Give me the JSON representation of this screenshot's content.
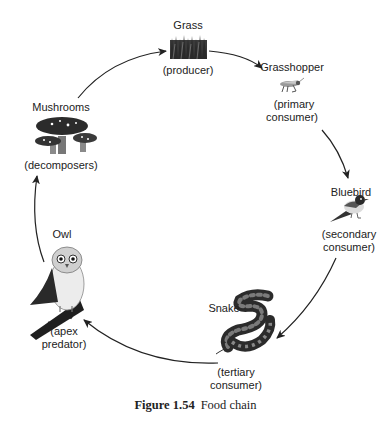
{
  "diagram": {
    "type": "cycle",
    "nodes": [
      {
        "id": "grass",
        "name": "Grass",
        "role": "(producer)"
      },
      {
        "id": "grasshopper",
        "name": "Grasshopper",
        "role_line1": "(primary",
        "role_line2": "consumer)"
      },
      {
        "id": "bluebird",
        "name": "Bluebird",
        "role_line1": "(secondary",
        "role_line2": "consumer)"
      },
      {
        "id": "snake",
        "name": "Snake",
        "role_line1": "(tertiary",
        "role_line2": "consumer)"
      },
      {
        "id": "owl",
        "name": "Owl",
        "role_line1": "(apex",
        "role_line2": "predator)"
      },
      {
        "id": "mushrooms",
        "name": "Mushrooms",
        "role": "(decomposers)"
      }
    ],
    "edges": [
      {
        "from": "grass",
        "to": "grasshopper"
      },
      {
        "from": "grasshopper",
        "to": "bluebird"
      },
      {
        "from": "bluebird",
        "to": "snake"
      },
      {
        "from": "snake",
        "to": "owl"
      },
      {
        "from": "owl",
        "to": "mushrooms"
      },
      {
        "from": "mushrooms",
        "to": "grass"
      }
    ]
  },
  "caption": {
    "figure_label": "Figure 1.54",
    "title": "Food chain"
  }
}
